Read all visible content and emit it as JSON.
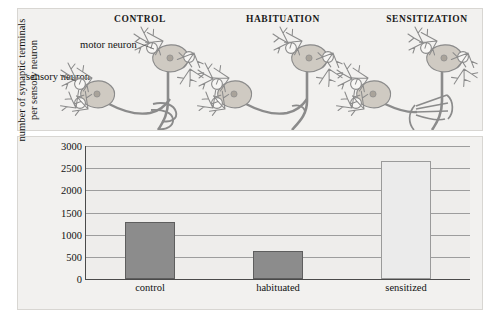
{
  "diagram": {
    "panels": [
      {
        "title": "CONTROL",
        "terminals": 2,
        "id": "control"
      },
      {
        "title": "HABITUATION",
        "terminals": 1,
        "id": "habituation"
      },
      {
        "title": "SENSITIZATION",
        "terminals": 4,
        "id": "sensitization"
      }
    ],
    "labels": {
      "motor_neuron": "motor neuron",
      "sensory_neuron_line1": "sensory",
      "sensory_neuron_line2": "neuron"
    },
    "colors": {
      "soma_fill": "#cfcac2",
      "nucleus_fill": "#a9a39a",
      "outline": "#8b8b8b",
      "panel_bg": "#f2f1ef"
    }
  },
  "chart_data": {
    "type": "bar",
    "categories": [
      "control",
      "habituated",
      "sensitized"
    ],
    "values": [
      1280,
      630,
      2670
    ],
    "title": "",
    "xlabel": "",
    "ylabel": "number of synaptic terminals per sensory neuron",
    "ylabel_line1": "number of synaptic terminals",
    "ylabel_line2": "per sensory neuron",
    "ylim": [
      0,
      3000
    ],
    "yticks": [
      0,
      500,
      1000,
      1500,
      2000,
      2500,
      3000
    ],
    "ytick_labels": [
      "0",
      "500",
      "1000",
      "1500",
      "2000",
      "2500",
      "3000"
    ],
    "grid": true,
    "legend": "none",
    "bar_colors": [
      "#8c8c8c",
      "#8c8c8c",
      "#ebebeb"
    ],
    "plot_bg": "#eeedeb"
  }
}
